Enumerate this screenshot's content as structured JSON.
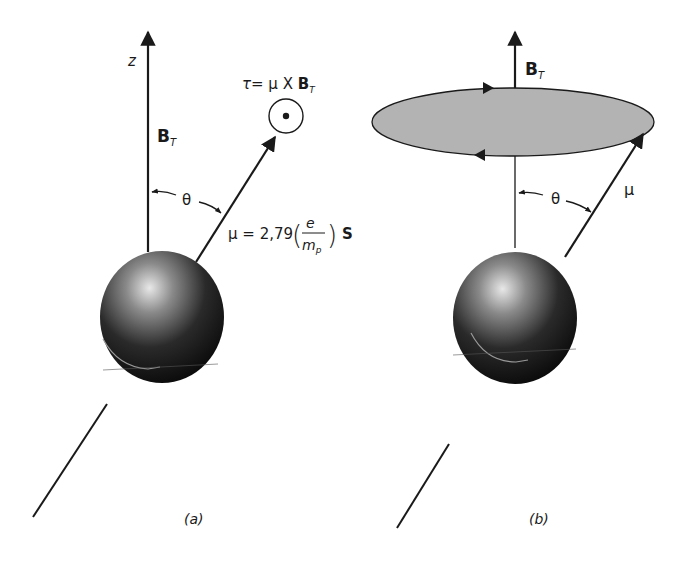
{
  "panel_a": {
    "caption": "(a)",
    "z_axis_label": "z",
    "field_label_main": "B",
    "field_label_sub": "T",
    "theta_label": "θ",
    "torque_label": {
      "tau": "τ",
      "equals_mu_x": "= μ X ",
      "B": "B",
      "sub": "T"
    },
    "moment_label": {
      "prefix": "μ = 2,79",
      "numerator": "e",
      "denominator_main": "m",
      "denominator_sub": "p",
      "suffix": "S"
    },
    "torque_symbol": "out-of-page-dot-icon"
  },
  "panel_b": {
    "caption": "(b)",
    "field_label_main": "B",
    "field_label_sub": "T",
    "theta_label": "θ",
    "mu_label": "μ",
    "precession_orbit": "gray-ellipse"
  },
  "colors": {
    "stroke": "#1a1a1a",
    "ellipse_fill": "#b3b3b3",
    "sphere_dark": "#0d0d0d",
    "sphere_highlight": "#e6e6e6"
  }
}
